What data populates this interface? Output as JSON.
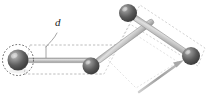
{
  "figure": {
    "type": "kinematic-linkage-diagram",
    "background_color": "#ffffff",
    "width": 210,
    "height": 96,
    "labels": {
      "offset_distance": "d"
    },
    "colors": {
      "sphere_dark": "#4a4a4a",
      "sphere_mid": "#6f6f6f",
      "sphere_light": "#b9b9b9",
      "sphere_highlight": "#d8d8d8",
      "link_fill": "#b8b8b8",
      "link_edge": "#8e8e8e",
      "dashed_outline": "#c9c9c9",
      "dashed_circle": "#4d4d4d",
      "arrow": "#a8a8a8",
      "leader_line": "#9a9a9a",
      "label_text": "#1a1a1a"
    },
    "joints": [
      {
        "name": "joint-base-left",
        "cx": 18,
        "cy": 60,
        "r": 10.5,
        "highlighted": true
      },
      {
        "name": "joint-elbow-lower",
        "cx": 91,
        "cy": 66,
        "r": 8.5,
        "highlighted": false
      },
      {
        "name": "joint-apex-top",
        "cx": 128,
        "cy": 13,
        "r": 9.0,
        "highlighted": false
      },
      {
        "name": "joint-end-right",
        "cx": 191,
        "cy": 56,
        "r": 9.0,
        "highlighted": false
      }
    ],
    "links": [
      {
        "name": "link-base-to-elbow",
        "from": "joint-base-left",
        "to": "joint-elbow-lower",
        "thickness": 4
      },
      {
        "name": "link-elbow-to-apex",
        "from": "joint-elbow-lower",
        "to": "joint-apex-top",
        "thickness": 5
      },
      {
        "name": "link-apex-to-end",
        "from": "joint-apex-top",
        "to": "joint-end-right",
        "thickness": 5
      }
    ],
    "selection_circle": {
      "name": "joint-selection-circle",
      "cx": 18,
      "cy": 60,
      "r": 15.5,
      "style": "dashed"
    },
    "ghost_outline": {
      "name": "offset-ghost-outline",
      "style": "dashed",
      "description": "dashed offset path surrounding the linkage chain"
    },
    "inner_ghost_outline": {
      "name": "inner-ghost-diamond",
      "style": "dashed",
      "description": "faint dashed diamond inside the upper linkage loop"
    },
    "dimension": {
      "name": "offset-dimension-d",
      "label": "d",
      "label_x": 59,
      "label_y": 22,
      "tick_x": 46,
      "tick_y_top": 47,
      "tick_y_bottom": 60
    },
    "arrow": {
      "name": "direction-arrow",
      "x1": 140,
      "y1": 91,
      "x2": 182,
      "y2": 62,
      "head_length": 10
    }
  }
}
